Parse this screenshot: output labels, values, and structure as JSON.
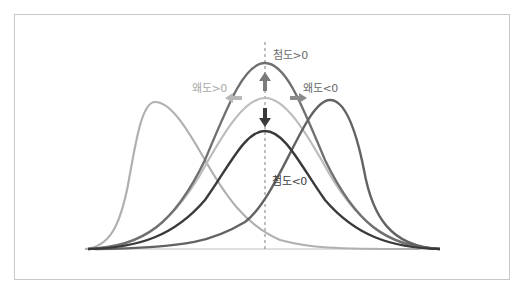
{
  "diagram": {
    "labels": {
      "kurtosis_positive": "첨도>0",
      "kurtosis_negative": "첨도<0",
      "skew_positive": "왜도>0",
      "skew_negative": "왜도<0"
    },
    "colors": {
      "frame": "#c8c8c8",
      "baseline": "#c0c0c0",
      "center_dash": "#808080",
      "skew_pos_curve": "#b0b0b0",
      "tall_curve": "#707070",
      "normal_curve": "#bcbcbc",
      "flat_curve": "#3a3a3a",
      "skew_neg_curve": "#636363",
      "label_light": "#a8a8a8",
      "label_mid": "#6a6a6a",
      "label_dark": "#404040"
    },
    "curves": [
      {
        "name": "skew-positive",
        "peak_x": 155,
        "peak_y": 102
      },
      {
        "name": "kurtosis-positive",
        "peak_x": 265,
        "peak_y": 63
      },
      {
        "name": "normal",
        "peak_x": 265,
        "peak_y": 98
      },
      {
        "name": "kurtosis-negative",
        "peak_x": 265,
        "peak_y": 131
      },
      {
        "name": "skew-negative",
        "peak_x": 330,
        "peak_y": 100
      }
    ],
    "baseline": {
      "y": 249,
      "x_start": 85,
      "x_end": 440
    },
    "center_x": 265
  }
}
